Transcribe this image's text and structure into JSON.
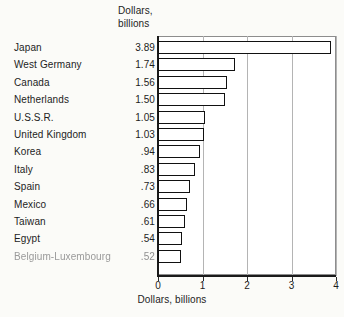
{
  "chart_data": {
    "type": "bar",
    "orientation": "horizontal",
    "title": "",
    "column_header": "Dollars,\nbillions",
    "xlabel": "Dollars, billions",
    "ylabel": "",
    "xlim": [
      0,
      4
    ],
    "xticks": [
      "0",
      "1",
      "2",
      "3",
      "4"
    ],
    "grid": true,
    "legend": null,
    "categories": [
      "Japan",
      "West Germany",
      "Canada",
      "Netherlands",
      "U.S.S.R.",
      "United Kingdom",
      "Korea",
      "Italy",
      "Spain",
      "Mexico",
      "Taiwan",
      "Egypt",
      "Belgium-Luxembourg"
    ],
    "values": [
      3.89,
      1.74,
      1.56,
      1.5,
      1.05,
      1.03,
      0.94,
      0.83,
      0.73,
      0.66,
      0.61,
      0.54,
      0.52
    ],
    "value_labels": [
      "3.89",
      "1.74",
      "1.56",
      "1.50",
      "1.05",
      "1.03",
      ".94",
      ".83",
      ".73",
      ".66",
      ".61",
      ".54",
      ".52"
    ],
    "bar_fill": "#ffffff",
    "bar_stroke": "#111111",
    "background": "#fbfbf8",
    "plot_background": "#ffffff",
    "gridline_color": "#b4b4b4"
  }
}
